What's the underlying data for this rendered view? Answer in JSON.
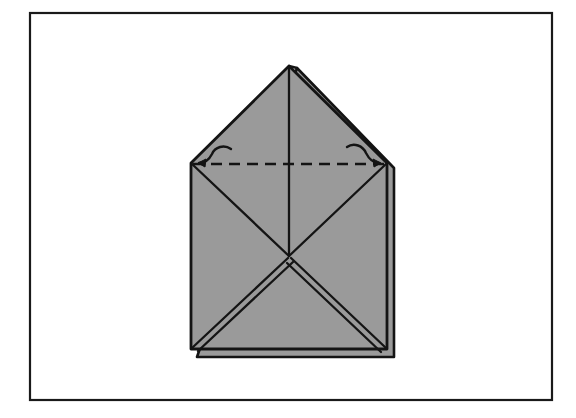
{
  "page": {
    "width": 576,
    "height": 418,
    "background_color": "#ffffff",
    "domain": "Diagram"
  },
  "frame": {
    "name": "outer-border",
    "x": 30,
    "y": 13,
    "width": 522,
    "height": 387,
    "stroke_color": "#1a1a1a",
    "stroke_width": 2.2,
    "fill": "none"
  },
  "figure": {
    "fill_color": "#9a9a9a",
    "line_color": "#141414",
    "paper_outline": "M 289 66 L 191 163 L 191 349 L 387 349 L 387 163 Z",
    "apex": {
      "x": 289,
      "y": 66
    },
    "left_shoulder": {
      "x": 191,
      "y": 163
    },
    "right_shoulder": {
      "x": 387,
      "y": 163
    },
    "bottom_left": {
      "x": 191,
      "y": 349
    },
    "bottom_right": {
      "x": 387,
      "y": 349
    },
    "center_x_intersection": {
      "x": 289,
      "y": 256
    },
    "layers": {
      "second_peak": {
        "x": 297,
        "y": 68
      },
      "right_edge_offset_x": 394,
      "bottom_edge_offset_y": 357,
      "bottom_offset_left_x": 197,
      "note": "doubled outline along upper-right flap, right side and bottom indicates extra paper layer"
    },
    "creases": [
      {
        "name": "center-vertical-crease",
        "from": [
          289,
          66
        ],
        "to": [
          289,
          256
        ],
        "style": "solid"
      },
      {
        "name": "diagonal-upper-left-to-center",
        "from": [
          191,
          163
        ],
        "to": [
          289,
          256
        ],
        "style": "solid"
      },
      {
        "name": "diagonal-upper-right-to-center",
        "from": [
          387,
          163
        ],
        "to": [
          289,
          256
        ],
        "style": "solid"
      },
      {
        "name": "diagonal-lower-left-from-center",
        "from": [
          289,
          256
        ],
        "to": [
          191,
          349
        ],
        "style": "solid-double"
      },
      {
        "name": "diagonal-lower-right-from-center",
        "from": [
          289,
          256
        ],
        "to": [
          387,
          349
        ],
        "style": "solid-double"
      }
    ],
    "fold_line": {
      "name": "valley-fold-dashed-line",
      "from": [
        193,
        164
      ],
      "to": [
        385,
        164
      ],
      "style": "dashed",
      "dash_pattern": "11 7",
      "stroke_width": 2.4
    },
    "arrows": [
      {
        "name": "fold-arrow-left",
        "path": "M 230 150 C 224 146 216 148 213 154 C 210 160 205 163 198 163",
        "arrowhead_at": [
          196,
          163
        ],
        "direction": "points-left-toward-fold-line-end"
      },
      {
        "name": "fold-arrow-right",
        "path": "M 348 148 C 354 144 362 147 365 153 C 368 159 373 163 380 163",
        "arrowhead_at": [
          382,
          163
        ],
        "direction": "points-right-toward-fold-line-end"
      }
    ]
  },
  "labels": {
    "caption": "",
    "step_number": ""
  }
}
